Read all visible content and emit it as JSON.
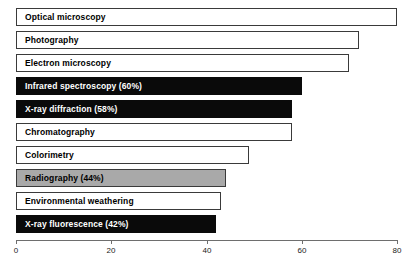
{
  "chart_data": {
    "type": "bar",
    "orientation": "horizontal",
    "title": "",
    "xlabel": "",
    "ylabel": "",
    "xlim": [
      0,
      80
    ],
    "xticks": [
      0,
      20,
      40,
      60,
      80
    ],
    "grid": false,
    "legend": false,
    "categories": [
      "Optical microscopy",
      "Photography",
      "Electron microscopy",
      "Infrared spectroscopy (60%)",
      "X-ray diffraction (58%)",
      "Chromatography",
      "Colorimetry",
      "Radiography (44%)",
      "Environmental weathering",
      "X-ray fluorescence (42%)"
    ],
    "values": [
      80,
      72,
      70,
      60,
      58,
      58,
      49,
      44,
      43,
      42
    ],
    "bars": [
      {
        "label": "Optical microscopy",
        "value": 80,
        "fill": "white",
        "text_color": "#000000"
      },
      {
        "label": "Photography",
        "value": 72,
        "fill": "white",
        "text_color": "#000000"
      },
      {
        "label": "Electron microscopy",
        "value": 70,
        "fill": "white",
        "text_color": "#000000"
      },
      {
        "label": "Infrared spectroscopy (60%)",
        "value": 60,
        "fill": "black",
        "text_color": "#ffffff"
      },
      {
        "label": "X-ray diffraction (58%)",
        "value": 58,
        "fill": "black",
        "text_color": "#ffffff"
      },
      {
        "label": "Chromatography",
        "value": 58,
        "fill": "white",
        "text_color": "#000000"
      },
      {
        "label": "Colorimetry",
        "value": 49,
        "fill": "white",
        "text_color": "#000000"
      },
      {
        "label": "Radiography (44%)",
        "value": 44,
        "fill": "gray",
        "text_color": "#000000"
      },
      {
        "label": "Environmental weathering",
        "value": 43,
        "fill": "white",
        "text_color": "#000000"
      },
      {
        "label": "X-ray fluorescence (42%)",
        "value": 42,
        "fill": "black",
        "text_color": "#ffffff"
      }
    ],
    "colors": {
      "fill_white": "#ffffff",
      "fill_black": "#0a0a0a",
      "fill_gray": "#a9a9a9",
      "bar_outline": "#3a3a3a",
      "axis": "#6e6e6e",
      "tick_text": "#222222"
    }
  }
}
